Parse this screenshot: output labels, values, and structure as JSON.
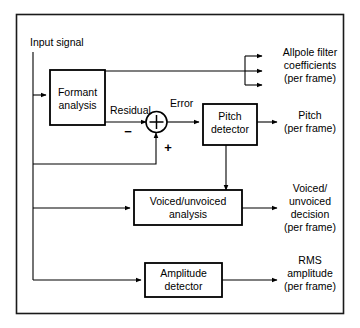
{
  "figure": {
    "type": "block-diagram",
    "domain": "speech-coding-analysis",
    "border_color": "#1a1a1a",
    "line_color": "#000000",
    "background_color": "#ffffff"
  },
  "labels": {
    "input_signal": "Input signal",
    "residual": "Residual",
    "error": "Error",
    "minus_sign": "−",
    "plus_sign": "+"
  },
  "blocks": [
    {
      "id": "formant",
      "line1": "Formant",
      "line2": "analysis"
    },
    {
      "id": "pitch",
      "line1": "Pitch",
      "line2": "detector"
    },
    {
      "id": "voiced",
      "line1": "Voiced/unvoiced",
      "line2": "analysis"
    },
    {
      "id": "amplitude",
      "line1": "Amplitude",
      "line2": "detector"
    }
  ],
  "outputs": [
    {
      "id": "allpole",
      "lines": [
        "Allpole filter",
        "coefficients",
        "(per frame)"
      ],
      "arrow_count": 3
    },
    {
      "id": "pitch-out",
      "lines": [
        "Pitch",
        "(per frame)"
      ],
      "arrow_count": 1
    },
    {
      "id": "voiced-out",
      "lines": [
        "Voiced/",
        "unvoiced",
        "decision",
        "(per frame)"
      ],
      "arrow_count": 1
    },
    {
      "id": "rms-out",
      "lines": [
        "RMS",
        "amplitude",
        "(per frame)"
      ],
      "arrow_count": 1
    }
  ],
  "summing_node": {
    "id": "summer",
    "symbol": "plus-cross",
    "inputs": [
      {
        "from": "formant-residual",
        "sign": "−",
        "direction": "left"
      },
      {
        "from": "input-signal-feedback",
        "sign": "+",
        "direction": "bottom"
      }
    ],
    "output": {
      "to": "pitch",
      "label": "Error"
    }
  }
}
